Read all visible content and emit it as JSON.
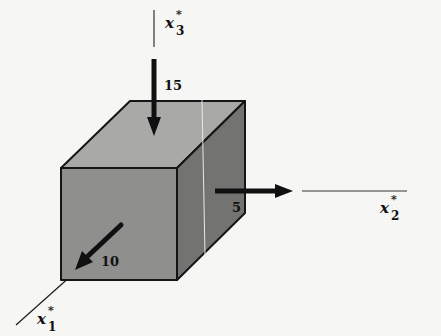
{
  "figure": {
    "axes": [
      {
        "id": "x1",
        "symbol": "x",
        "superscript": "*",
        "subscript": "1"
      },
      {
        "id": "x2",
        "symbol": "x",
        "superscript": "*",
        "subscript": "2"
      },
      {
        "id": "x3",
        "symbol": "x",
        "superscript": "*",
        "subscript": "3"
      }
    ],
    "forces": [
      {
        "axis": "x3",
        "value": "15",
        "direction": "downward onto top face"
      },
      {
        "axis": "x2",
        "value": "5",
        "direction": "outward from right face"
      },
      {
        "axis": "x1",
        "value": "10",
        "direction": "outward from front face toward viewer"
      }
    ],
    "colors": {
      "top_face": "#a9a9a7",
      "front_face": "#8f8f8d",
      "side_face": "#737371",
      "edge": "#151515",
      "arrow": "#101010",
      "background": "#f6f6f4"
    }
  }
}
